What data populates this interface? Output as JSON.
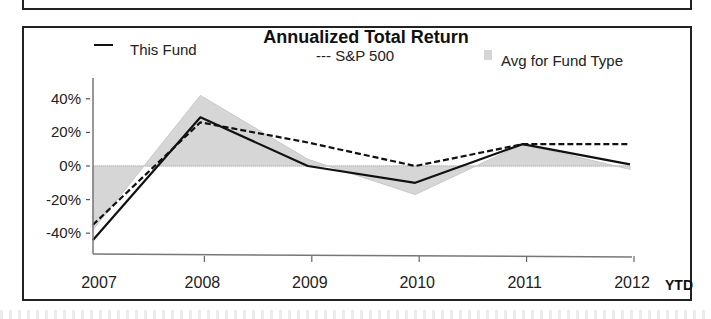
{
  "chart_data": {
    "type": "line",
    "title": "Annualized Total Return",
    "xlabel": "",
    "ylabel": "",
    "categories": [
      "2007",
      "2008",
      "2009",
      "2010",
      "2011",
      "2012"
    ],
    "x_suffix_label": "YTD",
    "yticks": [
      "40%",
      "20%",
      "0%",
      "-20%",
      "-40%"
    ],
    "ytick_values": [
      40,
      20,
      0,
      -20,
      -40
    ],
    "ylim": [
      -50,
      48
    ],
    "grid": false,
    "legend_position": "top",
    "series": [
      {
        "name": "This Fund",
        "style": "solid",
        "values": [
          -44,
          29,
          0,
          -10,
          13,
          1
        ]
      },
      {
        "name": "S&P 500",
        "style": "dashed",
        "values": [
          -35,
          26,
          14,
          0,
          13,
          13
        ]
      },
      {
        "name": "Avg for Fund Type",
        "style": "shaded-area",
        "values": [
          -38,
          42,
          4,
          -17,
          13,
          -2
        ]
      }
    ]
  },
  "legend": {
    "fund": "This Fund",
    "sp": "--- S&P 500",
    "avg": "Avg for Fund Type"
  },
  "colors": {
    "line": "#111111",
    "area": "#d6d6d6",
    "frame": "#222222"
  }
}
